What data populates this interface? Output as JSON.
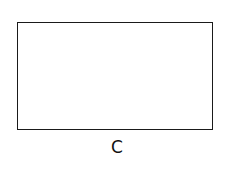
{
  "diagram": {
    "shapes": [
      {
        "type": "rectangle",
        "label": "C",
        "stroke_color": "#1a1a1a",
        "fill_color": "#ffffff"
      }
    ]
  }
}
